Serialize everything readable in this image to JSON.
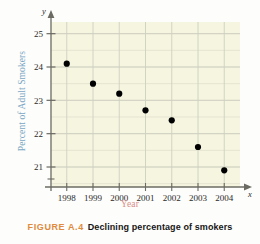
{
  "figure": {
    "caption_number": "FIGURE A.4",
    "caption_text": "Declining percentage of smokers",
    "number_color": "#e08a3c",
    "text_color": "#161616"
  },
  "chart_data": {
    "type": "scatter",
    "title": "",
    "xlabel": "Year",
    "ylabel": "Percent of Adult Smokers",
    "xlabel_color": "#d98d86",
    "ylabel_color": "#7ba7c4",
    "plot_background": "#f5f5e0",
    "grid": true,
    "grid_color": "#cfcfc0",
    "point_color": "#000000",
    "axis_color": "#6b6b63",
    "x_axis_symbol": "x",
    "y_axis_symbol": "y",
    "categories": [
      1998,
      1999,
      2000,
      2001,
      2002,
      2003,
      2004
    ],
    "xtick_labels": [
      "1998",
      "1999",
      "2000",
      "2001",
      "2002",
      "2003",
      "2004"
    ],
    "ytick_labels": [
      "25",
      "24",
      "23",
      "22",
      "21"
    ],
    "ytick_values": [
      25,
      24,
      23,
      22,
      21
    ],
    "values": [
      24.1,
      23.5,
      23.2,
      22.7,
      22.4,
      21.6,
      20.9
    ],
    "ylim": [
      20.4,
      25.35
    ],
    "xlim": [
      1997.4,
      2004.6
    ],
    "minor_grid_step": 0.25
  }
}
